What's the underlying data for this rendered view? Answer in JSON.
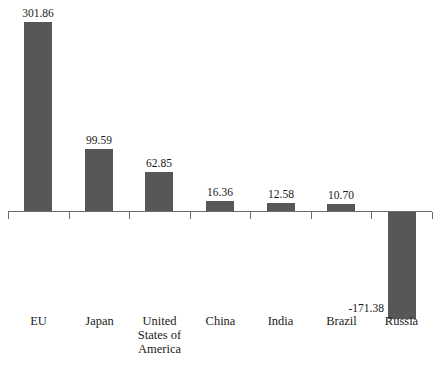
{
  "chart_data": {
    "type": "bar",
    "title": "",
    "subtitle": "",
    "xlabel": "",
    "ylabel": "",
    "categories": [
      "EU",
      "Japan",
      "United States of America",
      "China",
      "India",
      "Brazil",
      "Russia"
    ],
    "category_label_lines": [
      [
        "EU"
      ],
      [
        "Japan"
      ],
      [
        "United",
        "States of",
        "America"
      ],
      [
        "China"
      ],
      [
        "India"
      ],
      [
        "Brazil"
      ],
      [
        "Russia"
      ]
    ],
    "values": [
      301.86,
      99.59,
      62.85,
      16.36,
      12.58,
      10.7,
      -171.38
    ],
    "value_labels": [
      "301.86",
      "99.59",
      "62.85",
      "16.36",
      "12.58",
      "10.70",
      "-171.38"
    ],
    "ylim": [
      -171.38,
      301.86
    ],
    "grid": false,
    "legend": false,
    "legend_position": "none",
    "bar_color": "#575757",
    "axis_color": "#6a6a6a",
    "background_color": "#ffffff",
    "baseline_value": 0,
    "label_placement": [
      "above",
      "above",
      "above",
      "above",
      "above",
      "above",
      "left-of-bar"
    ]
  }
}
